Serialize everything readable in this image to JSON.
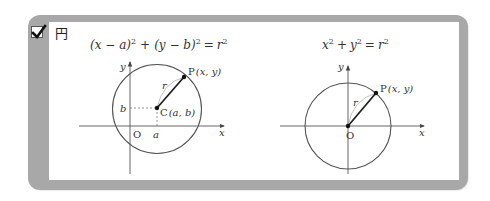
{
  "header": {
    "checkbox_checked": true,
    "title": "円"
  },
  "left_figure": {
    "formula": {
      "p1": "(x − a)",
      "e1": "2",
      "plus": "+",
      "p2": "(y − b)",
      "e2": "2",
      "eq": "=",
      "r": "r",
      "e3": "2"
    },
    "labels": {
      "x_axis": "x",
      "y_axis": "y",
      "origin": "O",
      "a": "a",
      "b": "b",
      "center": "C",
      "center_coords": "(a, b)",
      "point": "P",
      "point_coords": "(x, y)",
      "radius": "r"
    }
  },
  "right_figure": {
    "formula": {
      "x": "x",
      "e1": "2",
      "plus": "+",
      "y": "y",
      "e2": "2",
      "eq": "=",
      "r": "r",
      "e3": "2"
    },
    "labels": {
      "x_axis": "x",
      "y_axis": "y",
      "origin": "O",
      "point": "P",
      "point_coords": "(x, y)",
      "radius": "r"
    }
  },
  "colors": {
    "frame": "#a8a8a8",
    "circle": "#555555",
    "axis": "#555555",
    "radius_line": "#222222"
  }
}
